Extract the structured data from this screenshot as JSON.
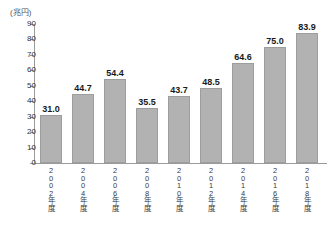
{
  "chart_data": {
    "type": "bar",
    "title": "",
    "unit_label": "(兆円)",
    "xlabel": "",
    "ylabel": "",
    "ylim": [
      0,
      90
    ],
    "ytick_step": 10,
    "yticks": [
      90,
      80,
      70,
      60,
      50,
      40,
      30,
      20,
      10,
      0
    ],
    "grid": false,
    "legend": false,
    "categories": [
      "2002年度",
      "2004年度",
      "2006年度",
      "2008年度",
      "2010年度",
      "2012年度",
      "2014年度",
      "2016年度",
      "2018年度"
    ],
    "values": [
      31.0,
      44.7,
      54.4,
      35.5,
      43.7,
      48.5,
      64.6,
      75.0,
      83.9
    ],
    "value_labels": [
      "31.0",
      "44.7",
      "54.4",
      "35.5",
      "43.7",
      "48.5",
      "64.6",
      "75.0",
      "83.9"
    ],
    "bar_color": "#b2b2b2",
    "bar_border_color": "#9d9d9d",
    "axis_color": "#9a9a9a",
    "background_color": "#ffffff",
    "text_color": "#1a1a1a"
  }
}
